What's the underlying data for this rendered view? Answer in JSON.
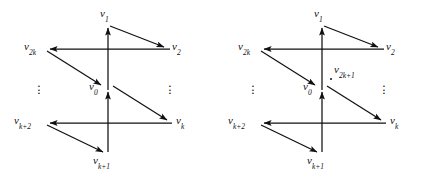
{
  "figure": {
    "background_color": "#ffffff",
    "stroke_color": "#111111",
    "panels": [
      {
        "id": "left",
        "name": "digraph-wheel-even",
        "labels": {
          "v1": {
            "base": "v",
            "sub": "1"
          },
          "v2": {
            "base": "v",
            "sub": "2"
          },
          "v2k": {
            "base": "v",
            "sub": "2k"
          },
          "v0": {
            "base": "v",
            "sub": "0"
          },
          "vk": {
            "base": "v",
            "sub": "k"
          },
          "vk2": {
            "base": "v",
            "sub": "k+2"
          },
          "vk1": {
            "base": "v",
            "sub": "k+1"
          }
        },
        "ellipsis_left": "⋮",
        "ellipsis_right": "⋮",
        "extra_vertex": null
      },
      {
        "id": "right",
        "name": "digraph-wheel-odd",
        "labels": {
          "v1": {
            "base": "v",
            "sub": "1"
          },
          "v2": {
            "base": "v",
            "sub": "2"
          },
          "v2k": {
            "base": "v",
            "sub": "2k"
          },
          "v0": {
            "base": "v",
            "sub": "0"
          },
          "vk": {
            "base": "v",
            "sub": "k"
          },
          "vk2": {
            "base": "v",
            "sub": "k+2"
          },
          "vk1": {
            "base": "v",
            "sub": "k+1"
          },
          "v2k1": {
            "base": "v",
            "sub": "2k+1"
          }
        },
        "ellipsis_left": "⋮",
        "ellipsis_right": "⋮",
        "extra_vertex": {
          "base": "v",
          "sub": "2k+1"
        }
      }
    ]
  },
  "graph_data": {
    "type": "directed-graph",
    "description": "Two wheel-like digraphs on a hub vertex v0 with rim vertices v1, v2, vk, vk+1, vk+2, v2k; the right diagram additionally contains an isolated vertex v2k+1.",
    "panels": [
      {
        "id": "left",
        "vertices": [
          "v0",
          "v1",
          "v2",
          "vk",
          "vk+1",
          "vk+2",
          "v2k"
        ],
        "edges": [
          {
            "from": "v0",
            "to": "v1"
          },
          {
            "from": "v1",
            "to": "v2"
          },
          {
            "from": "v2",
            "to": "v2k"
          },
          {
            "from": "v2k",
            "to": "v0"
          },
          {
            "from": "v0",
            "to": "vk"
          },
          {
            "from": "vk",
            "to": "vk+2"
          },
          {
            "from": "vk+2",
            "to": "vk+1"
          },
          {
            "from": "vk+1",
            "to": "v0"
          }
        ]
      },
      {
        "id": "right",
        "vertices": [
          "v0",
          "v1",
          "v2",
          "vk",
          "vk+1",
          "vk+2",
          "v2k",
          "v2k+1"
        ],
        "edges": [
          {
            "from": "v0",
            "to": "v1"
          },
          {
            "from": "v1",
            "to": "v2"
          },
          {
            "from": "v2",
            "to": "v2k"
          },
          {
            "from": "v2k",
            "to": "v0"
          },
          {
            "from": "v0",
            "to": "vk"
          },
          {
            "from": "vk",
            "to": "vk+2"
          },
          {
            "from": "vk+2",
            "to": "vk+1"
          },
          {
            "from": "vk+1",
            "to": "v0"
          }
        ],
        "isolated": [
          "v2k+1"
        ]
      }
    ]
  }
}
